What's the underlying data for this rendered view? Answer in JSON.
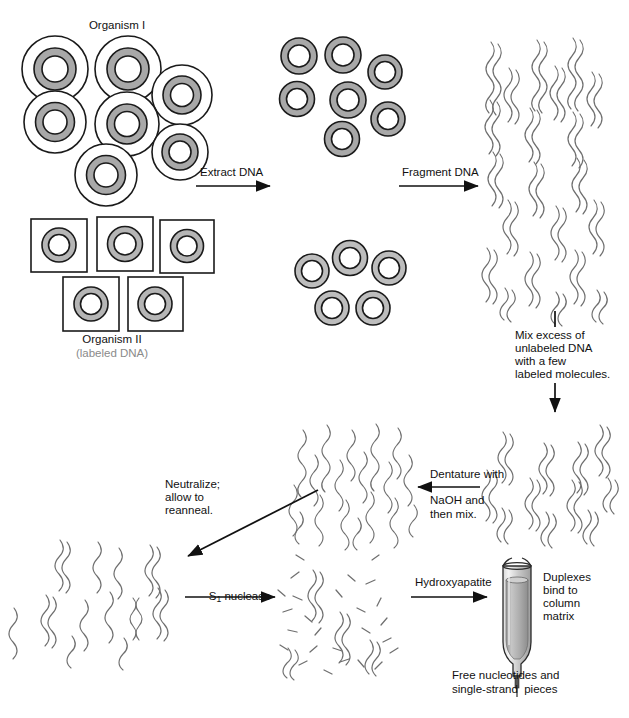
{
  "diagram": {
    "title_hidden": "",
    "labels": {
      "organism1": "Organism I",
      "organism2": "Organism II",
      "organism2_sub": "(labeled DNA)",
      "extract_dna": "Extract DNA",
      "fragment_dna": "Fragment DNA",
      "mix_line1": "Mix excess of",
      "mix_line2": "unlabeled DNA",
      "mix_line3": "with a few",
      "mix_line4": "labeled molecules.",
      "denature_line1": "Dentature with",
      "denature_line2": "NaOH and",
      "denature_line3": "then mix.",
      "neutralize_line1": "Neutralize;",
      "neutralize_line2": "allow to",
      "neutralize_line3": "reanneal.",
      "s1_nuclease_pre": "S",
      "s1_nuclease_sub": "1",
      "s1_nuclease_post": " nuclease",
      "hydroxyapatite": "Hydroxyapatite",
      "duplexes_line1": "Duplexes",
      "duplexes_line2": "bind to",
      "duplexes_line3": "column",
      "duplexes_line4": "matrix",
      "free_line1": "Free nucleotides and",
      "free_line2": "single-strand  pieces"
    },
    "colors": {
      "outline": "#1a1a1a",
      "nucleus_fill": "#a8a8a8",
      "nucleus_fill_light": "#bdbdbd",
      "cell_fill": "#ffffff",
      "dna_stroke": "#6f6f6f",
      "dna_stroke_dark": "#555555",
      "label_gray": "#8a8a8a",
      "column_matrix": "#b5b5b5",
      "column_glass": "#e8e8e8"
    },
    "counts": {
      "organism1_cells": 7,
      "organism2_cells": 5,
      "nuclei_top": 7,
      "nuclei_bottom": 5
    }
  }
}
